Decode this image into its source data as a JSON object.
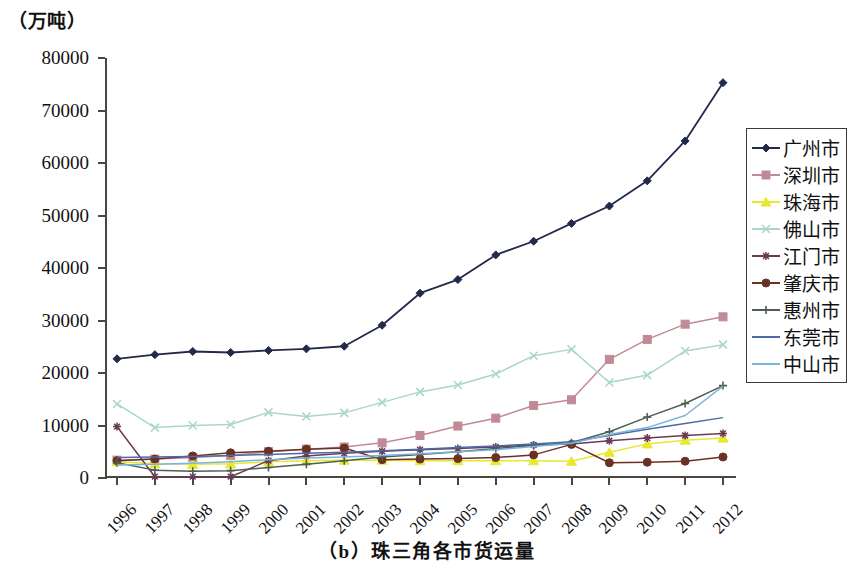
{
  "figure": {
    "unit_label": "（万吨）",
    "caption": "（b）珠三角各市货运量"
  },
  "chart_data": {
    "type": "line",
    "title": "（b）珠三角各市货运量",
    "xlabel": "",
    "ylabel": "（万吨）",
    "ylim": [
      0,
      80000
    ],
    "ytick_step": 10000,
    "grid": false,
    "legend_position": "right",
    "x": [
      "1996",
      "1997",
      "1998",
      "1999",
      "2000",
      "2001",
      "2002",
      "2003",
      "2004",
      "2005",
      "2006",
      "2007",
      "2008",
      "2009",
      "2010",
      "2011",
      "2012"
    ],
    "ytick_labels": [
      "0",
      "10000",
      "20000",
      "30000",
      "40000",
      "50000",
      "60000",
      "70000",
      "80000"
    ],
    "series": [
      {
        "name": "广州市",
        "color": "#23294a",
        "marker": "diamond",
        "values": [
          22700,
          23500,
          24100,
          23900,
          24300,
          24600,
          25100,
          29100,
          35200,
          37800,
          42500,
          45100,
          48500,
          51800,
          56600,
          64200,
          75300
        ]
      },
      {
        "name": "深圳市",
        "color": "#c08a96",
        "marker": "square",
        "values": [
          3400,
          3600,
          3900,
          4300,
          5000,
          5500,
          5900,
          6700,
          8100,
          9900,
          11400,
          13800,
          14900,
          22600,
          26400,
          29300,
          30700
        ]
      },
      {
        "name": "珠海市",
        "color": "#e8e82e",
        "marker": "triangle",
        "values": [
          3100,
          2700,
          2600,
          2700,
          3100,
          3300,
          3400,
          3400,
          3300,
          3300,
          3300,
          3300,
          3200,
          4900,
          6500,
          7200,
          7600
        ]
      },
      {
        "name": "佛山市",
        "color": "#a9d6cb",
        "marker": "x",
        "values": [
          14100,
          9600,
          10000,
          10200,
          12500,
          11700,
          12400,
          14400,
          16400,
          17700,
          19800,
          23300,
          24500,
          18200,
          19600,
          24200,
          25400
        ]
      },
      {
        "name": "江门市",
        "color": "#6b3b56",
        "marker": "asterisk",
        "values": [
          9800,
          250,
          250,
          250,
          3300,
          4200,
          4700,
          5100,
          5400,
          5600,
          5900,
          6300,
          6500,
          7100,
          7600,
          8100,
          8500
        ]
      },
      {
        "name": "肇庆市",
        "color": "#6b3224",
        "marker": "circle",
        "values": [
          3300,
          3600,
          4200,
          4800,
          5100,
          5500,
          5700,
          3500,
          3600,
          3700,
          3900,
          4400,
          6400,
          2900,
          3000,
          3200,
          4000
        ]
      },
      {
        "name": "惠州市",
        "color": "#4e5e52",
        "marker": "plus",
        "values": [
          2900,
          1500,
          1300,
          1400,
          2000,
          2600,
          3300,
          4000,
          4500,
          5000,
          5600,
          6200,
          6700,
          8800,
          11600,
          14200,
          17600
        ]
      },
      {
        "name": "东莞市",
        "color": "#4a6ba8",
        "marker": "line",
        "values": [
          3900,
          4000,
          4100,
          4300,
          4500,
          4700,
          4900,
          5200,
          5500,
          5800,
          6100,
          6500,
          6900,
          8100,
          9300,
          10400,
          11500
        ]
      },
      {
        "name": "中山市",
        "color": "#7ab4dd",
        "marker": "line",
        "values": [
          2500,
          2600,
          2800,
          3100,
          3500,
          3800,
          4000,
          4300,
          4600,
          5000,
          5400,
          6000,
          6600,
          8300,
          9600,
          11900,
          17500
        ]
      }
    ]
  },
  "legend": {
    "items": [
      {
        "label": "广州市"
      },
      {
        "label": "深圳市"
      },
      {
        "label": "珠海市"
      },
      {
        "label": "佛山市"
      },
      {
        "label": "江门市"
      },
      {
        "label": "肇庆市"
      },
      {
        "label": "惠州市"
      },
      {
        "label": "东莞市"
      },
      {
        "label": "中山市"
      }
    ]
  }
}
